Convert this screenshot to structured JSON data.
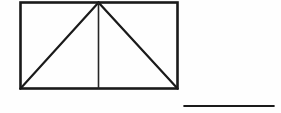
{
  "figure": {
    "background_color": "#fefefe",
    "ink_color": "#1a1a1a",
    "canvas": {
      "width": 281,
      "height": 113
    },
    "rectangle": {
      "name": "outer-rectangle",
      "left": 20.5,
      "top": 2.5,
      "right": 177.5,
      "bottom": 88.5,
      "width": 157,
      "height": 86,
      "stroke_width": 2.6,
      "color": "#1a1a1a"
    },
    "apex": {
      "x": 98.5,
      "y": 2.5,
      "label": "top-center apex"
    },
    "bottom_left_vertex": {
      "x": 20.5,
      "y": 88.5
    },
    "bottom_right_vertex": {
      "x": 177.5,
      "y": 88.5
    },
    "diagonal_left": {
      "name": "left-diagonal",
      "x1": 20.5,
      "y1": 88.5,
      "x2": 98.5,
      "y2": 2.5,
      "stroke_width": 2.2,
      "color": "#1a1a1a"
    },
    "diagonal_right": {
      "name": "right-diagonal",
      "x1": 98.5,
      "y1": 2.5,
      "x2": 177.5,
      "y2": 88.5,
      "stroke_width": 2.2,
      "color": "#1a1a1a"
    },
    "median_line": {
      "name": "vertical-median",
      "x1": 98.5,
      "y1": 2.5,
      "x2": 98.5,
      "y2": 88.5,
      "stroke_width": 1.6,
      "color": "#262626"
    },
    "answer_rule": {
      "name": "answer-underline",
      "x1": 184.5,
      "y1": 106.0,
      "x2": 273.5,
      "y2": 106.0,
      "length": 89,
      "stroke_width": 2.2,
      "color": "#1a1a1a"
    }
  }
}
